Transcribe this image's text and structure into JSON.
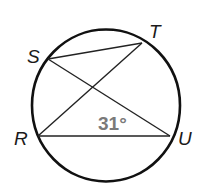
{
  "diagram": {
    "type": "circle with inscribed chords",
    "points": {
      "S": {
        "label": "S",
        "x": 48,
        "y": 59
      },
      "T": {
        "label": "T",
        "x": 142,
        "y": 43
      },
      "R": {
        "label": "R",
        "x": 38,
        "y": 136
      },
      "U": {
        "label": "U",
        "x": 170,
        "y": 136
      }
    },
    "chords": [
      "ST",
      "SU",
      "RT",
      "RU"
    ],
    "angle_label": "31°",
    "colors": {
      "stroke": "#111111",
      "angle_text": "#7a7a7a"
    }
  }
}
